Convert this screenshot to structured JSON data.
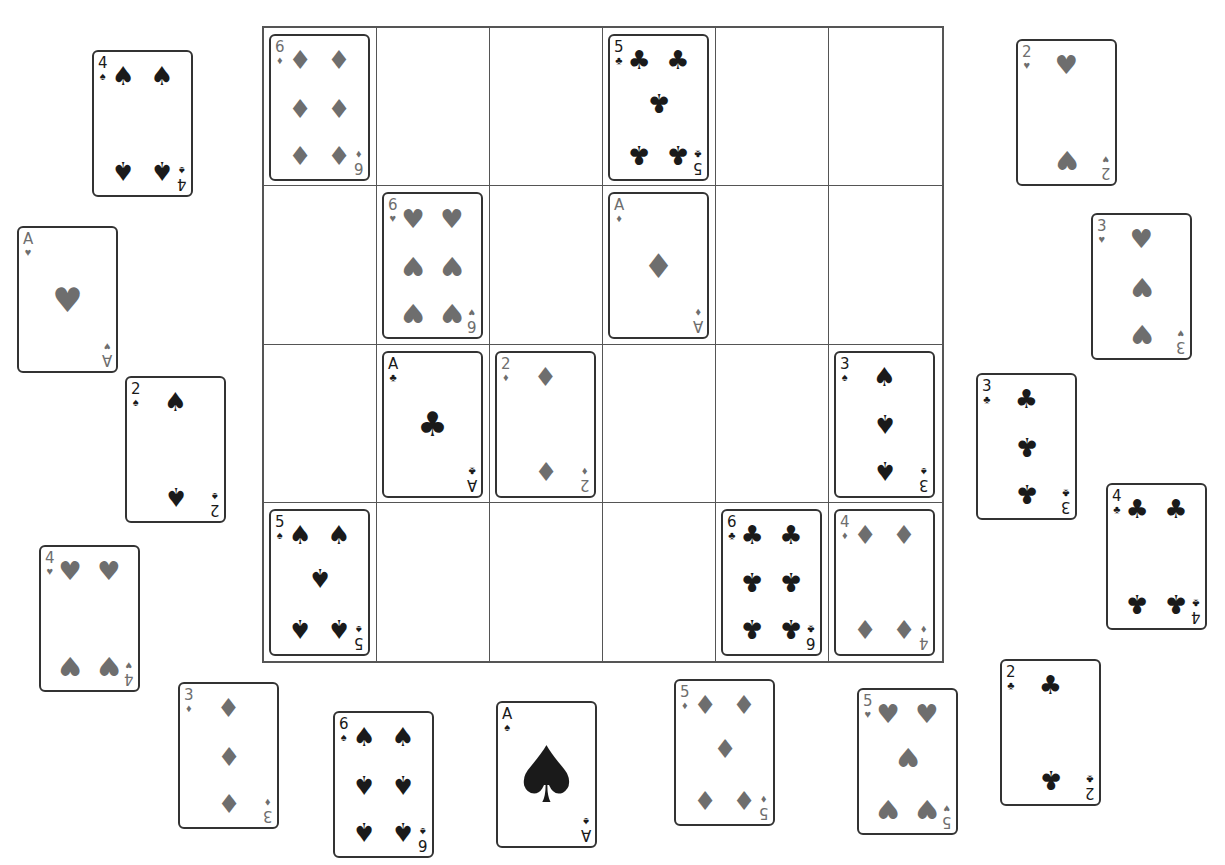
{
  "board": {
    "rows": 4,
    "cols": 6,
    "cells": [
      {
        "row": 0,
        "col": 0,
        "rank": "6",
        "suit": "diamonds"
      },
      {
        "row": 0,
        "col": 3,
        "rank": "5",
        "suit": "clubs"
      },
      {
        "row": 1,
        "col": 1,
        "rank": "6",
        "suit": "hearts"
      },
      {
        "row": 1,
        "col": 3,
        "rank": "A",
        "suit": "diamonds"
      },
      {
        "row": 2,
        "col": 1,
        "rank": "A",
        "suit": "clubs"
      },
      {
        "row": 2,
        "col": 2,
        "rank": "2",
        "suit": "diamonds"
      },
      {
        "row": 2,
        "col": 5,
        "rank": "3",
        "suit": "spades"
      },
      {
        "row": 3,
        "col": 0,
        "rank": "5",
        "suit": "spades"
      },
      {
        "row": 3,
        "col": 4,
        "rank": "6",
        "suit": "clubs"
      },
      {
        "row": 3,
        "col": 5,
        "rank": "4",
        "suit": "diamonds"
      }
    ]
  },
  "loose_cards": [
    {
      "rank": "4",
      "suit": "spades",
      "x": 92,
      "y": 50
    },
    {
      "rank": "A",
      "suit": "hearts",
      "x": 17,
      "y": 226
    },
    {
      "rank": "2",
      "suit": "spades",
      "x": 125,
      "y": 376
    },
    {
      "rank": "4",
      "suit": "hearts",
      "x": 39,
      "y": 545
    },
    {
      "rank": "3",
      "suit": "diamonds",
      "x": 178,
      "y": 682
    },
    {
      "rank": "6",
      "suit": "spades",
      "x": 333,
      "y": 711
    },
    {
      "rank": "A",
      "suit": "spades",
      "x": 496,
      "y": 701,
      "big_ace": true
    },
    {
      "rank": "5",
      "suit": "diamonds",
      "x": 674,
      "y": 679
    },
    {
      "rank": "5",
      "suit": "hearts",
      "x": 857,
      "y": 688
    },
    {
      "rank": "2",
      "suit": "clubs",
      "x": 1000,
      "y": 659
    },
    {
      "rank": "2",
      "suit": "hearts",
      "x": 1016,
      "y": 39
    },
    {
      "rank": "3",
      "suit": "hearts",
      "x": 1091,
      "y": 213
    },
    {
      "rank": "3",
      "suit": "clubs",
      "x": 976,
      "y": 373
    },
    {
      "rank": "4",
      "suit": "clubs",
      "x": 1106,
      "y": 483
    }
  ],
  "suits": {
    "spades": {
      "glyph": "♠",
      "color": "#1a1a1a",
      "icon": "spade-icon"
    },
    "clubs": {
      "glyph": "♣",
      "color": "#1a1a1a",
      "icon": "club-icon"
    },
    "hearts": {
      "glyph": "♥",
      "color": "#6e6e6e",
      "icon": "heart-icon"
    },
    "diamonds": {
      "glyph": "♦",
      "color": "#6e6e6e",
      "icon": "diamond-icon"
    }
  }
}
